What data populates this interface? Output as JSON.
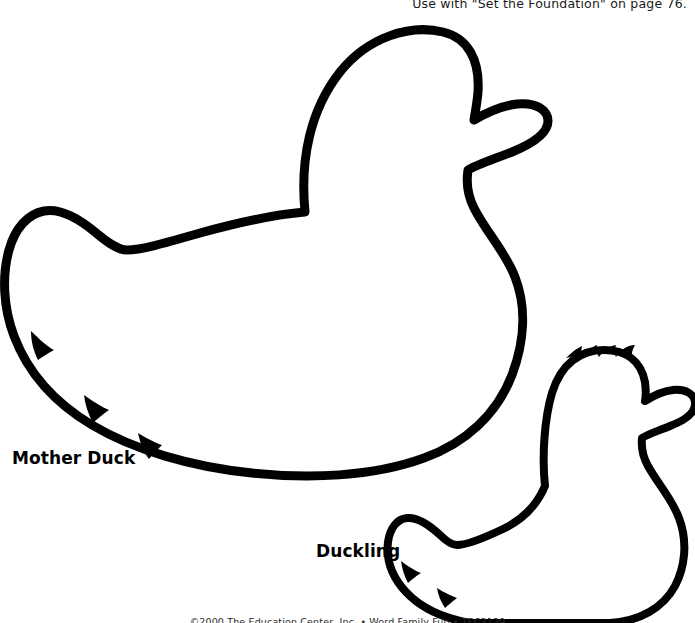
{
  "page": {
    "background_color": "#ffffff",
    "ink_color": "#000000",
    "width": 695,
    "height": 623
  },
  "header": {
    "note": "Use with \"Set the Foundation\" on page 76.",
    "clipped": true
  },
  "footer": {
    "copyright": "©2000 The Education Center, Inc. • Word Family Fun • TEC3139",
    "clipped": true
  },
  "shapes": [
    {
      "id": "mother-duck",
      "label": "Mother Duck",
      "label_x": 12,
      "label_y": 448,
      "description": "Large duck outline facing right with rounded head, flat beak, curved back, feathered tail at left",
      "stroke_color": "#000000",
      "fill_color": "#ffffff"
    },
    {
      "id": "duckling",
      "label": "Duckling",
      "label_x": 316,
      "label_y": 541,
      "description": "Small duck outline facing right with tufted head, short beak, rounded body, feathered tail at left",
      "stroke_color": "#000000",
      "fill_color": "#ffffff"
    }
  ],
  "icons": {
    "mother_duck_outline": "duck-outline-large",
    "duckling_outline": "duck-outline-small"
  }
}
